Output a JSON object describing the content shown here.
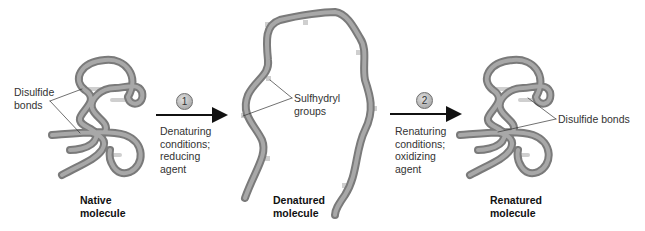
{
  "panels": {
    "native": {
      "title_line1": "Native",
      "title_line2": "molecule",
      "callout_line1": "Disulfide",
      "callout_line2": "bonds"
    },
    "denatured": {
      "title_line1": "Denatured",
      "title_line2": "molecule",
      "callout_line1": "Sulfhydryl",
      "callout_line2": "groups"
    },
    "renatured": {
      "title_line1": "Renatured",
      "title_line2": "molecule",
      "callout": "Disulfide bonds"
    }
  },
  "steps": [
    {
      "number": "1",
      "line1": "Denaturing",
      "line2": "conditions;",
      "line3": "reducing",
      "line4": "agent"
    },
    {
      "number": "2",
      "line1": "Renaturing",
      "line2": "conditions;",
      "line3": "oxidizing",
      "line4": "agent"
    }
  ],
  "colors": {
    "tube": "#8a8a8a",
    "tube_highlight": "#c4c4c4",
    "bond": "#cfcfcf",
    "arrow": "#111111"
  }
}
